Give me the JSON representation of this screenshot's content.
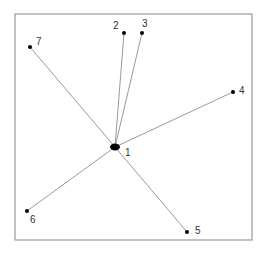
{
  "diagram": {
    "type": "star-network",
    "frame": {
      "x": 15,
      "y": 14,
      "width": 237,
      "height": 226,
      "stroke": "#9a9a9a"
    },
    "edge_color": "#9a9a9a",
    "node_color": "#000000",
    "hub": {
      "id": "1",
      "label": "1",
      "x": 115,
      "y": 147,
      "label_dx": 10,
      "label_dy": 9
    },
    "nodes": [
      {
        "id": "2",
        "label": "2",
        "x": 124,
        "y": 33,
        "label_dx": -11,
        "label_dy": -4
      },
      {
        "id": "3",
        "label": "3",
        "x": 142,
        "y": 33,
        "label_dx": 0,
        "label_dy": -6
      },
      {
        "id": "4",
        "label": "4",
        "x": 233,
        "y": 92,
        "label_dx": 6,
        "label_dy": 2
      },
      {
        "id": "5",
        "label": "5",
        "x": 187,
        "y": 232,
        "label_dx": 8,
        "label_dy": 2
      },
      {
        "id": "6",
        "label": "6",
        "x": 27,
        "y": 211,
        "label_dx": 3,
        "label_dy": 12
      },
      {
        "id": "7",
        "label": "7",
        "x": 30,
        "y": 47,
        "label_dx": 6,
        "label_dy": -2
      }
    ],
    "edges": [
      {
        "from": "1",
        "to": "2"
      },
      {
        "from": "1",
        "to": "3"
      },
      {
        "from": "1",
        "to": "4"
      },
      {
        "from": "1",
        "to": "5"
      },
      {
        "from": "1",
        "to": "6"
      },
      {
        "from": "1",
        "to": "7"
      }
    ]
  }
}
